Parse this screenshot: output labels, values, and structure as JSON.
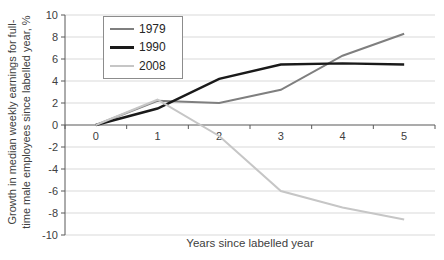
{
  "chart_data": {
    "type": "line",
    "xlabel": "Years since labelled year",
    "ylabel": "Growth in median weekly earnings for full-time male employees since labelled year, %",
    "ylabel_lines": [
      "Growth in median weekly earnings for full-",
      "time male employees since labelled year, %"
    ],
    "x_tick_labels": [
      "0",
      "1",
      "2",
      "3",
      "4",
      "5"
    ],
    "y_tick_labels": [
      "10",
      "8",
      "6",
      "4",
      "2",
      "0",
      "-2",
      "-4",
      "-6",
      "-8",
      "-10"
    ],
    "ylim": [
      -10,
      10
    ],
    "ytick_step": 2,
    "grid": true,
    "legend_position": "inside-top-left",
    "series": [
      {
        "name": "1979",
        "values": [
          0,
          2.2,
          2.0,
          3.2,
          6.3,
          8.3
        ],
        "color": "#7f7f7f",
        "stroke_width": 2
      },
      {
        "name": "1990",
        "values": [
          0,
          1.5,
          4.2,
          5.5,
          5.6,
          5.5
        ],
        "color": "#1a1a1a",
        "stroke_width": 2.4
      },
      {
        "name": "2008",
        "values": [
          0,
          2.3,
          -1.0,
          -6.0,
          -7.5,
          -8.6
        ],
        "color": "#c6c6c6",
        "stroke_width": 2
      }
    ],
    "colors": {
      "background": "#ffffff",
      "gridline": "#d9d9d9",
      "axis": "#595959",
      "text": "#404040",
      "legend_border": "#8c8c8c"
    }
  }
}
